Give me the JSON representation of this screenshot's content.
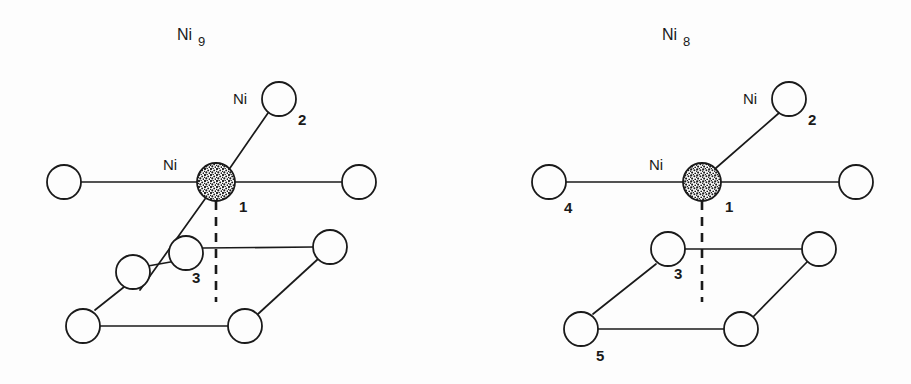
{
  "figure": {
    "background_color": "#fdfdfd",
    "line_color": "#1a1a1a",
    "caption_note": "Two ball-and-stick cluster models of nickel atoms on a surface"
  },
  "panels": [
    {
      "id": "ni9",
      "title_element": "Ni",
      "title_subscript": "9",
      "atom_labels": {
        "center_element": "Ni",
        "center_index": "1",
        "apex_element": "Ni",
        "apex_index": "2",
        "mid_index": "3"
      },
      "atom_count": 9,
      "shaded_atom": "Ni1",
      "atoms": [
        {
          "name": "Ni1",
          "cx": 216,
          "cy": 182,
          "r": 19,
          "fill": "stipple",
          "label": "Ni",
          "index": "1"
        },
        {
          "name": "Ni2",
          "cx": 279,
          "cy": 99,
          "r": 17,
          "fill": "open",
          "label": "Ni",
          "index": "2"
        },
        {
          "name": "Ni-left",
          "cx": 64,
          "cy": 182,
          "r": 17,
          "fill": "open",
          "label": "",
          "index": ""
        },
        {
          "name": "Ni-right",
          "cx": 359,
          "cy": 182,
          "r": 17,
          "fill": "open",
          "label": "",
          "index": ""
        },
        {
          "name": "Ni3",
          "cx": 186,
          "cy": 253,
          "r": 17,
          "fill": "open",
          "label": "",
          "index": "3"
        },
        {
          "name": "Ni-extra9",
          "cx": 133,
          "cy": 272,
          "r": 17,
          "fill": "open",
          "label": "",
          "index": ""
        },
        {
          "name": "Ni-mid-right",
          "cx": 330,
          "cy": 247,
          "r": 17,
          "fill": "open",
          "label": "",
          "index": ""
        },
        {
          "name": "Ni-bottom-left",
          "cx": 83,
          "cy": 326,
          "r": 17,
          "fill": "open",
          "label": "",
          "index": ""
        },
        {
          "name": "Ni-bottom-right",
          "cx": 245,
          "cy": 326,
          "r": 17,
          "fill": "open",
          "label": "",
          "index": ""
        }
      ]
    },
    {
      "id": "ni8",
      "title_element": "Ni",
      "title_subscript": "8",
      "atom_labels": {
        "center_element": "Ni",
        "center_index": "1",
        "apex_element": "Ni",
        "apex_index": "2",
        "mid_index": "3",
        "left_index": "4",
        "bottom_left_index": "5"
      },
      "atom_count": 8,
      "shaded_atom": "Ni1",
      "atoms": [
        {
          "name": "Ni1",
          "cx": 246,
          "cy": 182,
          "r": 19,
          "fill": "stipple",
          "label": "Ni",
          "index": "1"
        },
        {
          "name": "Ni2",
          "cx": 788,
          "cy": 99,
          "r": 17,
          "fill": "open",
          "label": "Ni",
          "index": "2"
        },
        {
          "name": "Ni4",
          "cx": 93,
          "cy": 182,
          "r": 17,
          "fill": "open",
          "label": "",
          "index": "4"
        },
        {
          "name": "Ni-right",
          "cx": 400,
          "cy": 182,
          "r": 17,
          "fill": "open",
          "label": "",
          "index": ""
        },
        {
          "name": "Ni3",
          "cx": 212,
          "cy": 249,
          "r": 17,
          "fill": "open",
          "label": "",
          "index": "3"
        },
        {
          "name": "Ni-mid-right",
          "cx": 363,
          "cy": 249,
          "r": 17,
          "fill": "open",
          "label": "",
          "index": ""
        },
        {
          "name": "Ni5",
          "cx": 125,
          "cy": 329,
          "r": 17,
          "fill": "open",
          "label": "",
          "index": "5"
        },
        {
          "name": "Ni-bottom-right",
          "cx": 285,
          "cy": 329,
          "r": 17,
          "fill": "open",
          "label": "",
          "index": ""
        }
      ]
    }
  ]
}
